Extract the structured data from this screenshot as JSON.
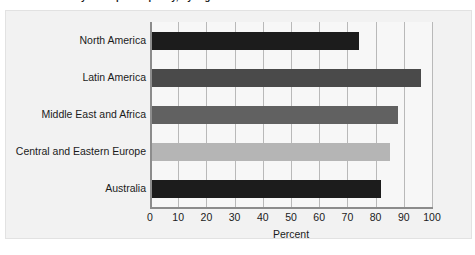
{
  "caption": "Personal delivery of corporate policy, by region",
  "chart_data": {
    "type": "bar",
    "orientation": "horizontal",
    "title": "",
    "xlabel": "Percent",
    "ylabel": "",
    "xlim": [
      0,
      100
    ],
    "xticks": [
      0,
      10,
      20,
      30,
      40,
      50,
      60,
      70,
      80,
      90,
      100
    ],
    "grid": true,
    "legend": false,
    "categories": [
      "North America",
      "Latin America",
      "Middle East and Africa",
      "Central and Eastern Europe",
      "Australia"
    ],
    "values": [
      74,
      96,
      88,
      85,
      82
    ],
    "colors": [
      "#1c1c1c",
      "#4a4a4a",
      "#616161",
      "#b5b5b5",
      "#1c1c1c"
    ]
  },
  "axis": {
    "x_title": "Percent"
  }
}
